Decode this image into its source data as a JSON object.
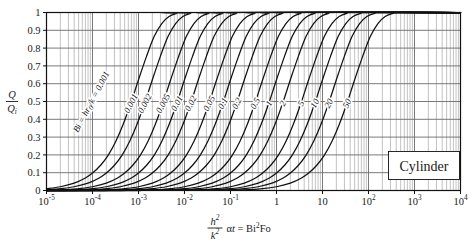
{
  "chart_data": {
    "type": "line",
    "title": "",
    "subtitle": "",
    "xlabel": "h²/k² αt = Bi²Fo",
    "ylabel": "Q/Qᵢ",
    "xscale": "log",
    "xlim": [
      1e-05,
      10000.0
    ],
    "ylim": [
      0,
      1
    ],
    "grid": true,
    "legend_position": "inline-curve-labels",
    "annotation_box": "Cylinder",
    "family_label": "Bi = hr₀/k = 0.001",
    "x_tick_labels": [
      "10⁻⁵",
      "10⁻⁴",
      "10⁻³",
      "10⁻²",
      "10⁻¹",
      "1",
      "10",
      "10²",
      "10³",
      "10⁴"
    ],
    "x_tick_values": [
      1e-05,
      0.0001,
      0.001,
      0.01,
      0.1,
      1,
      10,
      100,
      1000,
      10000
    ],
    "y_tick_labels": [
      "0",
      "0.1",
      "0.2",
      "0.3",
      "0.4",
      "0.5",
      "0.6",
      "0.7",
      "0.8",
      "0.9",
      "1"
    ],
    "y_tick_values": [
      0,
      0.1,
      0.2,
      0.3,
      0.4,
      0.5,
      0.6,
      0.7,
      0.8,
      0.9,
      1.0
    ],
    "series": [
      {
        "name": "0.001",
        "bi": 0.001,
        "label": "0.001",
        "x": [
          1e-05,
          2e-05,
          4e-05,
          7e-05,
          0.0001,
          0.00015,
          0.00022,
          0.00032,
          0.00046,
          0.00068,
          0.001,
          0.0015,
          0.0022,
          0.0032,
          0.0046,
          0.0068,
          0.01
        ],
        "y": [
          0.01,
          0.021,
          0.041,
          0.07,
          0.098,
          0.142,
          0.199,
          0.275,
          0.369,
          0.49,
          0.622,
          0.755,
          0.866,
          0.938,
          0.978,
          0.995,
          1.0
        ]
      },
      {
        "name": "0.002",
        "bi": 0.002,
        "label": "0.002",
        "x": [
          2e-05,
          4e-05,
          8e-05,
          0.00014,
          0.0002,
          0.0003,
          0.00044,
          0.00064,
          0.00092,
          0.00136,
          0.002,
          0.003,
          0.0044,
          0.0064,
          0.0092,
          0.0136,
          0.02
        ],
        "y": [
          0.01,
          0.021,
          0.041,
          0.07,
          0.098,
          0.142,
          0.199,
          0.275,
          0.369,
          0.49,
          0.622,
          0.755,
          0.866,
          0.938,
          0.978,
          0.995,
          1.0
        ]
      },
      {
        "name": "0.005",
        "bi": 0.005,
        "label": "0.005",
        "x": [
          5e-05,
          0.0001,
          0.0002,
          0.00035,
          0.0005,
          0.00075,
          0.0011,
          0.0016,
          0.0023,
          0.0034,
          0.005,
          0.0075,
          0.011,
          0.016,
          0.023,
          0.034,
          0.05
        ],
        "y": [
          0.01,
          0.021,
          0.041,
          0.07,
          0.098,
          0.142,
          0.199,
          0.275,
          0.369,
          0.49,
          0.622,
          0.755,
          0.866,
          0.938,
          0.978,
          0.995,
          1.0
        ]
      },
      {
        "name": "0.01",
        "bi": 0.01,
        "label": "0.01",
        "x": [
          0.0001,
          0.0002,
          0.0004,
          0.0007,
          0.001,
          0.0015,
          0.0022,
          0.0032,
          0.0046,
          0.0068,
          0.01,
          0.015,
          0.022,
          0.032,
          0.046,
          0.068,
          0.1
        ],
        "y": [
          0.01,
          0.021,
          0.041,
          0.07,
          0.098,
          0.142,
          0.199,
          0.275,
          0.369,
          0.49,
          0.622,
          0.755,
          0.866,
          0.938,
          0.978,
          0.995,
          1.0
        ]
      },
      {
        "name": "0.02",
        "bi": 0.02,
        "label": "0.02",
        "x": [
          0.0002,
          0.0004,
          0.0008,
          0.0014,
          0.002,
          0.003,
          0.0044,
          0.0064,
          0.0092,
          0.0136,
          0.02,
          0.03,
          0.044,
          0.064,
          0.092,
          0.136,
          0.2
        ],
        "y": [
          0.01,
          0.021,
          0.041,
          0.07,
          0.098,
          0.142,
          0.199,
          0.275,
          0.369,
          0.49,
          0.622,
          0.755,
          0.866,
          0.938,
          0.978,
          0.995,
          1.0
        ]
      },
      {
        "name": "0.05",
        "bi": 0.05,
        "label": "0.05",
        "x": [
          0.0005,
          0.001,
          0.002,
          0.0035,
          0.005,
          0.0075,
          0.011,
          0.016,
          0.023,
          0.034,
          0.05,
          0.075,
          0.11,
          0.16,
          0.23,
          0.34,
          0.5
        ],
        "y": [
          0.01,
          0.021,
          0.041,
          0.07,
          0.098,
          0.142,
          0.199,
          0.275,
          0.369,
          0.49,
          0.622,
          0.755,
          0.866,
          0.938,
          0.978,
          0.995,
          1.0
        ]
      },
      {
        "name": "0.1",
        "bi": 0.1,
        "label": "0.1",
        "x": [
          0.001,
          0.002,
          0.004,
          0.007,
          0.01,
          0.015,
          0.022,
          0.032,
          0.046,
          0.068,
          0.1,
          0.15,
          0.22,
          0.32,
          0.46,
          0.68,
          1.0
        ],
        "y": [
          0.01,
          0.021,
          0.041,
          0.07,
          0.098,
          0.142,
          0.199,
          0.275,
          0.369,
          0.49,
          0.622,
          0.755,
          0.866,
          0.938,
          0.978,
          0.995,
          1.0
        ]
      },
      {
        "name": "0.2",
        "bi": 0.2,
        "label": "0.2",
        "x": [
          0.002,
          0.004,
          0.008,
          0.014,
          0.02,
          0.03,
          0.044,
          0.064,
          0.092,
          0.136,
          0.2,
          0.3,
          0.44,
          0.64,
          0.92,
          1.36,
          2.0
        ],
        "y": [
          0.01,
          0.021,
          0.041,
          0.07,
          0.098,
          0.142,
          0.199,
          0.275,
          0.369,
          0.49,
          0.622,
          0.755,
          0.866,
          0.938,
          0.978,
          0.995,
          1.0
        ]
      },
      {
        "name": "0.5",
        "bi": 0.5,
        "label": "0.5",
        "x": [
          0.005,
          0.01,
          0.02,
          0.035,
          0.05,
          0.075,
          0.11,
          0.16,
          0.23,
          0.34,
          0.5,
          0.75,
          1.1,
          1.6,
          2.3,
          3.4,
          5.0
        ],
        "y": [
          0.01,
          0.021,
          0.041,
          0.07,
          0.098,
          0.142,
          0.199,
          0.275,
          0.369,
          0.49,
          0.622,
          0.755,
          0.866,
          0.938,
          0.978,
          0.995,
          1.0
        ]
      },
      {
        "name": "1",
        "bi": 1,
        "label": "1",
        "x": [
          0.01,
          0.02,
          0.04,
          0.07,
          0.1,
          0.15,
          0.22,
          0.32,
          0.46,
          0.68,
          1.0,
          1.5,
          2.2,
          3.2,
          4.6,
          6.8,
          10.0
        ],
        "y": [
          0.01,
          0.021,
          0.041,
          0.07,
          0.098,
          0.142,
          0.199,
          0.275,
          0.369,
          0.49,
          0.622,
          0.755,
          0.866,
          0.938,
          0.978,
          0.995,
          1.0
        ]
      },
      {
        "name": "2",
        "bi": 2,
        "label": "2",
        "x": [
          0.02,
          0.04,
          0.08,
          0.14,
          0.2,
          0.3,
          0.44,
          0.64,
          0.92,
          1.36,
          2.0,
          3.0,
          4.4,
          6.4,
          9.2,
          13.6,
          20.0
        ],
        "y": [
          0.01,
          0.021,
          0.041,
          0.07,
          0.098,
          0.142,
          0.199,
          0.275,
          0.369,
          0.49,
          0.622,
          0.755,
          0.866,
          0.938,
          0.978,
          0.995,
          1.0
        ]
      },
      {
        "name": "5",
        "bi": 5,
        "label": "5",
        "x": [
          0.05,
          0.1,
          0.2,
          0.35,
          0.5,
          0.75,
          1.1,
          1.6,
          2.3,
          3.4,
          5.0,
          7.5,
          11.0,
          16.0,
          23.0,
          34.0,
          50.0
        ],
        "y": [
          0.01,
          0.021,
          0.041,
          0.07,
          0.098,
          0.142,
          0.199,
          0.275,
          0.369,
          0.49,
          0.622,
          0.755,
          0.866,
          0.938,
          0.978,
          0.995,
          1.0
        ]
      },
      {
        "name": "10",
        "bi": 10,
        "label": "10",
        "x": [
          0.1,
          0.2,
          0.4,
          0.7,
          1.0,
          1.5,
          2.2,
          3.2,
          4.6,
          6.8,
          10.0,
          15.0,
          22.0,
          32.0,
          46.0,
          68.0,
          100.0
        ],
        "y": [
          0.01,
          0.021,
          0.041,
          0.07,
          0.098,
          0.142,
          0.199,
          0.275,
          0.369,
          0.49,
          0.622,
          0.755,
          0.866,
          0.938,
          0.978,
          0.995,
          1.0
        ]
      },
      {
        "name": "20",
        "bi": 20,
        "label": "20",
        "x": [
          0.2,
          0.4,
          0.8,
          1.4,
          2.0,
          3.0,
          4.4,
          6.4,
          9.2,
          13.6,
          20.0,
          30.0,
          44.0,
          64.0,
          92.0,
          136.0,
          200.0
        ],
        "y": [
          0.01,
          0.021,
          0.041,
          0.07,
          0.098,
          0.142,
          0.199,
          0.275,
          0.369,
          0.49,
          0.622,
          0.755,
          0.866,
          0.938,
          0.978,
          0.995,
          1.0
        ]
      },
      {
        "name": "50",
        "bi": 50,
        "label": "50",
        "x": [
          0.5,
          1.0,
          2.0,
          3.5,
          5.0,
          7.5,
          11.0,
          16.0,
          23.0,
          34.0,
          50.0,
          75.0,
          110.0,
          160.0,
          230.0,
          340.0,
          500.0
        ],
        "y": [
          0.01,
          0.021,
          0.041,
          0.07,
          0.098,
          0.142,
          0.199,
          0.275,
          0.369,
          0.49,
          0.622,
          0.755,
          0.866,
          0.938,
          0.978,
          0.995,
          1.0
        ]
      }
    ]
  },
  "axes": {
    "y_label_numerator": "Q",
    "y_label_denominator": "Q",
    "y_label_denominator_sub": "i",
    "x_label_num": "h",
    "x_label_num_sup": "2",
    "x_label_den": "k",
    "x_label_den_sup": "2",
    "x_label_rest_alpha": "α",
    "x_label_rest_t": "t",
    "x_label_eq": "= Bi",
    "x_label_eq_sup": "2",
    "x_label_fo": "Fo"
  },
  "annotations": {
    "box_text": "Cylinder",
    "family_bi": "Bi",
    "family_eq1": "=",
    "family_h": "h",
    "family_r": "r",
    "family_r_sub": "0",
    "family_k": "k",
    "family_eq2": "= 0.001"
  },
  "colors": {
    "curve": "#111111",
    "grid_major": "#6b6b6b",
    "grid_minor": "#9a9a9a",
    "axis": "#111111",
    "text": "#1a1a1a",
    "background": "#ffffff"
  }
}
